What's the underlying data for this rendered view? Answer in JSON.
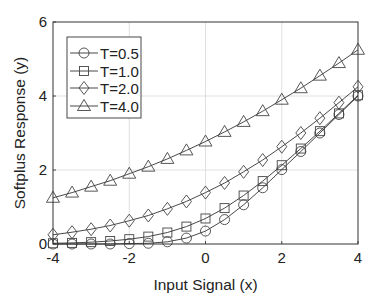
{
  "chart_data": {
    "type": "line",
    "title": "",
    "xlabel": "Input Signal (x)",
    "ylabel": "Softplus Response (y)",
    "xlim": [
      -4,
      4
    ],
    "ylim": [
      0,
      6
    ],
    "xticks": [
      -4,
      -2,
      0,
      2,
      4
    ],
    "xtick_labels": [
      "-4",
      "-2",
      "0",
      "2",
      "4"
    ],
    "yticks": [
      0,
      2,
      4,
      6
    ],
    "ytick_labels": [
      "0",
      "2",
      "4",
      "6"
    ],
    "grid": true,
    "legend_position": "upper left",
    "x": [
      -4,
      -3.5,
      -3,
      -2.5,
      -2,
      -1.5,
      -1,
      -0.5,
      0,
      0.5,
      1,
      1.5,
      2,
      2.5,
      3,
      3.5,
      4
    ],
    "series": [
      {
        "name": "T=0.5",
        "marker": "circle",
        "values": [
          0.0,
          0.0,
          0.0,
          0.0,
          0.01,
          0.02,
          0.06,
          0.16,
          0.35,
          0.66,
          1.06,
          1.52,
          2.01,
          2.5,
          3.0,
          3.5,
          4.0
        ]
      },
      {
        "name": "T=1.0",
        "marker": "square",
        "values": [
          0.02,
          0.03,
          0.05,
          0.08,
          0.13,
          0.2,
          0.31,
          0.47,
          0.69,
          0.97,
          1.31,
          1.7,
          2.13,
          2.58,
          3.05,
          3.53,
          4.02
        ]
      },
      {
        "name": "T=2.0",
        "marker": "diamond",
        "values": [
          0.25,
          0.32,
          0.4,
          0.5,
          0.63,
          0.77,
          0.95,
          1.15,
          1.39,
          1.65,
          1.95,
          2.27,
          2.63,
          3.0,
          3.4,
          3.82,
          4.25
        ]
      },
      {
        "name": "T=4.0",
        "marker": "triangle",
        "values": [
          1.25,
          1.39,
          1.55,
          1.71,
          1.9,
          2.09,
          2.3,
          2.53,
          2.77,
          3.03,
          3.3,
          3.59,
          3.9,
          4.21,
          4.55,
          4.89,
          5.25
        ]
      }
    ]
  }
}
